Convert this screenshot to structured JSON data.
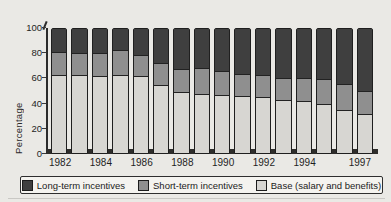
{
  "chart_data": {
    "type": "bar",
    "stacked": true,
    "title": "",
    "xlabel": "",
    "ylabel": "Percentage",
    "ylim": [
      0,
      100
    ],
    "yticks": [
      0,
      20,
      40,
      60,
      80,
      100
    ],
    "grid": false,
    "legend_position": "bottom",
    "categories": [
      "1982",
      "1983",
      "1984",
      "1985",
      "1986",
      "1987",
      "1988",
      "1989",
      "1990",
      "1991",
      "1992",
      "1993",
      "1994",
      "1995",
      "1996",
      "1997"
    ],
    "x_labels_shown": [
      "1982",
      "1984",
      "1986",
      "1988",
      "1990",
      "1992",
      "1994",
      "1997"
    ],
    "series": [
      {
        "name": "Base (salary and benefits)",
        "color": "#d7d6d2",
        "values": [
          62,
          62,
          61,
          62,
          61,
          54,
          48,
          47,
          46,
          45,
          44,
          42,
          41,
          39,
          34,
          31
        ]
      },
      {
        "name": "Short-term incentives",
        "color": "#8f8f8f",
        "values": [
          19,
          18,
          19,
          20,
          17,
          18,
          19,
          21,
          19,
          18,
          18,
          18,
          19,
          20,
          21,
          18
        ]
      },
      {
        "name": "Long-term incentives",
        "color": "#3f3f3f",
        "values": [
          19,
          20,
          20,
          18,
          22,
          28,
          33,
          32,
          35,
          37,
          38,
          40,
          40,
          41,
          45,
          51
        ]
      }
    ]
  },
  "axis": {
    "ylabel": "Percentage"
  },
  "legend": {
    "items": [
      {
        "label": "Long-term incentives",
        "color": "#3f3f3f"
      },
      {
        "label": "Short-term incentives",
        "color": "#8f8f8f"
      },
      {
        "label": "Base (salary and benefits)",
        "color": "#d7d6d2"
      }
    ]
  },
  "colors": {
    "background": "#eae9e5",
    "axis": "#2b2b2b",
    "bar_outline": "#1f1f1f",
    "floor": "#2e2d2b",
    "legend_background": "#f4f3ef",
    "text": "#1b1b1b"
  }
}
